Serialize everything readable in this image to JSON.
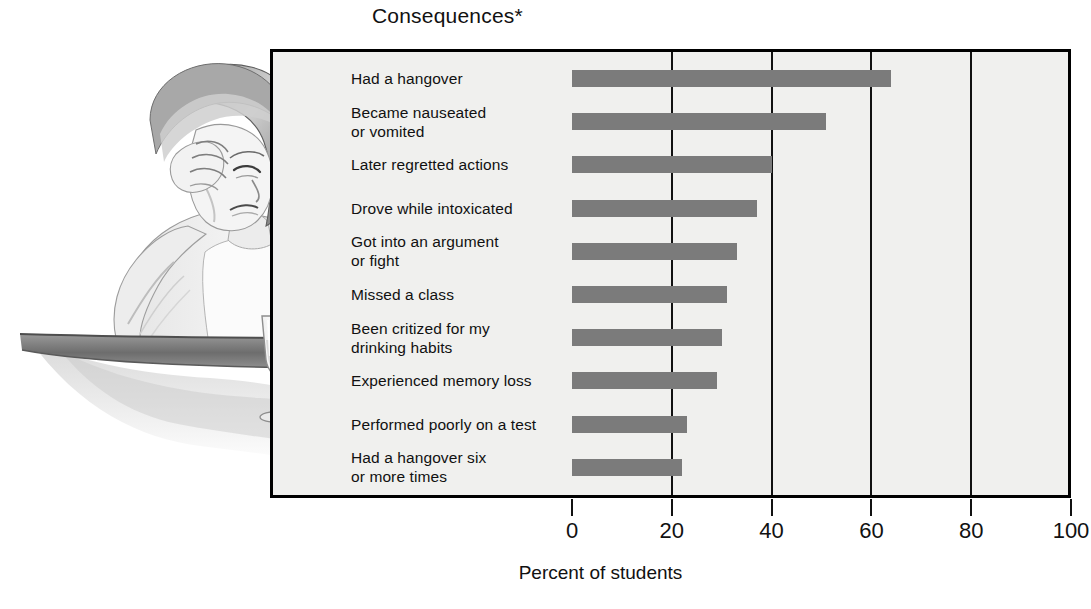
{
  "chart_data": {
    "type": "bar",
    "orientation": "horizontal",
    "title": "Consequences*",
    "xlabel": "Percent of students",
    "ylabel": "",
    "xlim": [
      0,
      100
    ],
    "xticks": [
      0,
      20,
      40,
      60,
      80,
      100
    ],
    "xticklabels": [
      "0",
      "20",
      "40",
      "60",
      "80",
      "100"
    ],
    "grid": true,
    "grid_axis": "x",
    "legend": false,
    "categories": [
      "Had a hangover",
      "Became nauseated\nor vomited",
      "Later regretted actions",
      "Drove while intoxicated",
      "Got into an argument\nor fight",
      "Missed a class",
      "Been critized for my\ndrinking habits",
      "Experienced memory loss",
      "Performed poorly on a test",
      "Had a hangover six\nor more times"
    ],
    "values": [
      64,
      51,
      40,
      37,
      33,
      31,
      30,
      29,
      23,
      22
    ],
    "bar_color": "#7b7b7b",
    "plot_background": "#f0f0ee",
    "frame_color": "#000000"
  },
  "illustration": {
    "name": "hungover-student-illustration",
    "description": "Pencil illustration of a woman seated at a table resting her head in her hand beside a wine glass"
  }
}
